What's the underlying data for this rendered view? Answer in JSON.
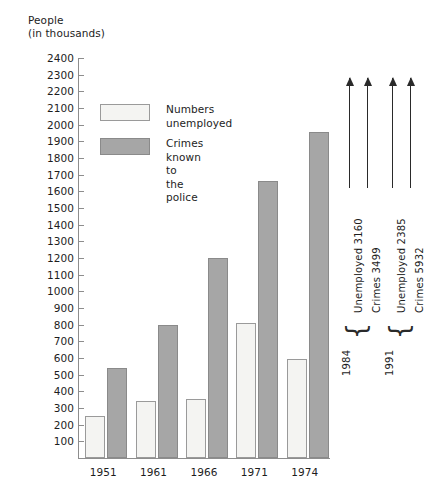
{
  "chart_data": {
    "type": "bar",
    "title": "",
    "xlabel": "",
    "ylabel": "People (in thousands)",
    "ylabel_line1": "People",
    "ylabel_line2": "(in thousands)",
    "categories": [
      "1951",
      "1961",
      "1966",
      "1971",
      "1974"
    ],
    "series": [
      {
        "name": "Numbers unemployed",
        "values": [
          255,
          340,
          355,
          810,
          595
        ]
      },
      {
        "name": "Crimes known to the police",
        "values": [
          540,
          800,
          1200,
          1660,
          1955
        ]
      }
    ],
    "ylim": [
      0,
      2400
    ],
    "ytick_step": 100,
    "ytick_labels": [
      "2400",
      "2300",
      "2200",
      "2100",
      "2000",
      "1900",
      "1800",
      "1700",
      "1600",
      "1500",
      "1400",
      "1300",
      "1200",
      "1100",
      "1000",
      "900",
      "800",
      "700",
      "600",
      "500",
      "400",
      "300",
      "200",
      "100"
    ],
    "grid": false,
    "legend_position": "upper-left-inside",
    "annotations": [
      {
        "year": "1984",
        "items": [
          {
            "label": "Unemployed 3160",
            "series": "Numbers unemployed",
            "value": 3160
          },
          {
            "label": "Crimes 3499",
            "series": "Crimes known to the police",
            "value": 3499
          }
        ]
      },
      {
        "year": "1991",
        "items": [
          {
            "label": "Unemployed 2385",
            "series": "Numbers unemployed",
            "value": 2385
          },
          {
            "label": "Crimes 5932",
            "series": "Crimes known to the police",
            "value": 5932
          }
        ]
      }
    ]
  },
  "legend": {
    "items": [
      {
        "label": "Numbers unemployed",
        "swatch": "unemployed",
        "color": "#f4f4f2"
      },
      {
        "label": "Crimes known to\nthe police",
        "swatch": "crimes",
        "color": "#a6a6a6"
      }
    ]
  },
  "caption": {
    "text": ""
  },
  "colors": {
    "unemployed_fill": "#f4f4f2",
    "unemployed_edge": "#9a9a9a",
    "crimes_fill": "#a6a6a6",
    "crimes_edge": "#8a8a8a",
    "axis": "#8d8d8d",
    "text": "#1d1d1d"
  }
}
